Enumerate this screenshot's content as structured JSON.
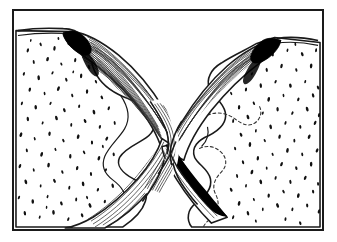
{
  "figure": {
    "title": "Anatomical line drawing: crossing fibrous bands between two stippled bone masses",
    "kind": "line-illustration",
    "style": "black ink on white, stipple shading, hatched fiber striations",
    "frame": {
      "border_color": "#1a1a1a",
      "border_width_px": 2,
      "x": 12,
      "y": 9,
      "width": 312,
      "height": 222,
      "background": "#ffffff"
    },
    "palette": {
      "ink": "#111111",
      "line": "#1a1a1a",
      "fill_dark": "#000000",
      "hatch": "#2b2b2b",
      "paper": "#ffffff",
      "dashed": "#333333"
    },
    "regions": [
      {
        "name": "left-bone-mass",
        "label": "left stippled bone mass",
        "side": "left",
        "texture": "stipple",
        "stipple_count": 150
      },
      {
        "name": "right-bone-mass",
        "label": "right stippled bone mass",
        "side": "right",
        "texture": "stipple",
        "stipple_count": 150
      },
      {
        "name": "left-fiber-band",
        "label": "left fibrous band sweeping to center",
        "texture": "striated hatching",
        "fiber_count": 26
      },
      {
        "name": "right-fiber-band",
        "label": "right fibrous band sweeping to center",
        "texture": "striated hatching",
        "fiber_count": 26
      },
      {
        "name": "central-crossing",
        "label": "central X-shaped decussation / waist",
        "texture": "dense vertical striations",
        "fiber_count": 22
      },
      {
        "name": "left-attachment",
        "label": "left dark attachment insertion",
        "texture": "solid fill"
      },
      {
        "name": "right-attachment",
        "label": "right dark attachment insertion",
        "texture": "solid fill"
      },
      {
        "name": "lower-dark-wedge",
        "label": "lower right solid black tapering wedge",
        "texture": "solid fill"
      },
      {
        "name": "right-dashed-outline",
        "label": "dashed internal contour on right mass",
        "texture": "dashed line"
      }
    ]
  }
}
